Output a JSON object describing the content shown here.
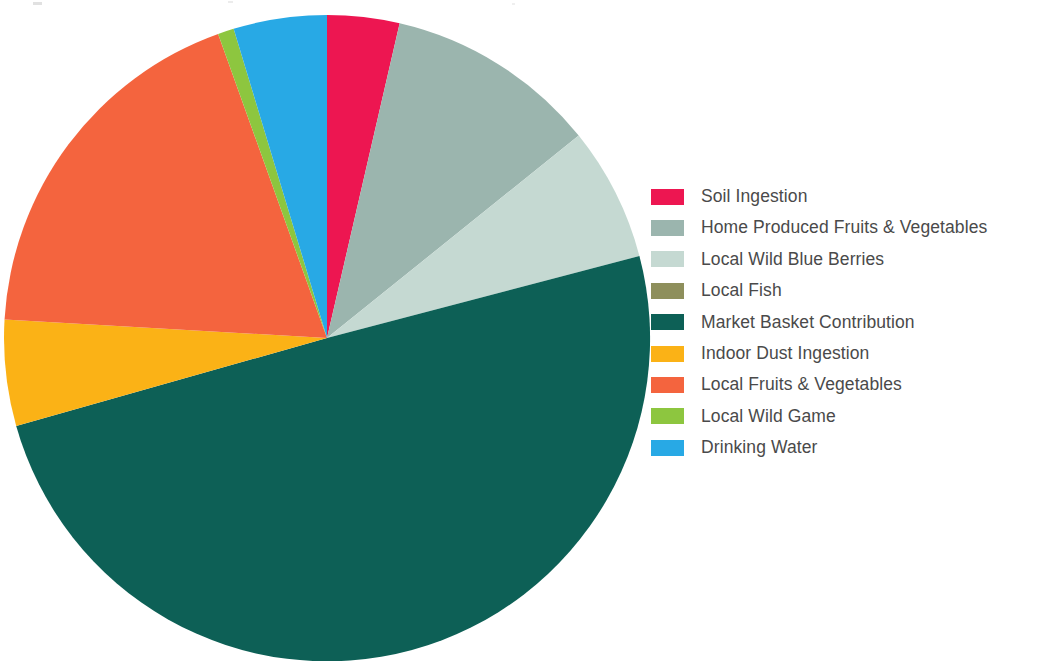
{
  "figure": {
    "background_color": "#ffffff",
    "legend_text_color": "#4a4a4a"
  },
  "chart_data": {
    "type": "pie",
    "title": "",
    "subtitle": "",
    "xlabel": "",
    "ylabel": "",
    "legend_position": "right",
    "grid": false,
    "start_angle_deg": 0,
    "direction": "clockwise",
    "units": "percent of total exposure",
    "categories": [
      "Soil Ingestion",
      "Home Produced Fruits & Vegetables",
      "Local Wild Blue Berries",
      "Local Fish",
      "Market Basket Contribution",
      "Indoor Dust Ingestion",
      "Local Fruits & Vegetables",
      "Local Wild Game",
      "Drinking Water"
    ],
    "values": [
      3.6,
      10.6,
      6.7,
      0.0,
      49.7,
      5.3,
      18.6,
      0.8,
      4.7
    ],
    "colors": [
      "#ED1651",
      "#9BB5AE",
      "#C5D9D2",
      "#8E8F5C",
      "#0D6056",
      "#FBB216",
      "#F4643E",
      "#8DC63F",
      "#28A9E5"
    ],
    "slices": [
      {
        "label": "Soil Ingestion",
        "value": 3.6,
        "color": "#ED1651",
        "start_deg": 0.0,
        "end_deg": 13.0
      },
      {
        "label": "Home Produced Fruits & Vegetables",
        "value": 10.6,
        "color": "#9BB5AE",
        "start_deg": 13.0,
        "end_deg": 51.2
      },
      {
        "label": "Local Wild Blue Berries",
        "value": 6.7,
        "color": "#C5D9D2",
        "start_deg": 51.2,
        "end_deg": 75.3
      },
      {
        "label": "Local Fish",
        "value": 0.0,
        "color": "#8E8F5C",
        "start_deg": 75.3,
        "end_deg": 75.3
      },
      {
        "label": "Market Basket Contribution",
        "value": 49.7,
        "color": "#0D6056",
        "start_deg": 75.3,
        "end_deg": 254.2
      },
      {
        "label": "Indoor Dust Ingestion",
        "value": 5.3,
        "color": "#FBB216",
        "start_deg": 254.2,
        "end_deg": 273.3
      },
      {
        "label": "Local Fruits & Vegetables",
        "value": 18.6,
        "color": "#F4643E",
        "start_deg": 273.3,
        "end_deg": 340.3
      },
      {
        "label": "Local Wild Game",
        "value": 0.8,
        "color": "#8DC63F",
        "start_deg": 340.3,
        "end_deg": 343.2
      },
      {
        "label": "Drinking Water",
        "value": 4.7,
        "color": "#28A9E5",
        "start_deg": 343.2,
        "end_deg": 360.0
      }
    ],
    "geometry": {
      "cx": 325,
      "cy": 325,
      "r": 323
    }
  },
  "legend": {
    "items": [
      {
        "label": "Soil Ingestion",
        "color": "#ED1651"
      },
      {
        "label": "Home Produced Fruits & Vegetables",
        "color": "#9BB5AE"
      },
      {
        "label": "Local Wild Blue Berries",
        "color": "#C5D9D2"
      },
      {
        "label": "Local Fish",
        "color": "#8E8F5C"
      },
      {
        "label": "Market Basket Contribution",
        "color": "#0D6056"
      },
      {
        "label": "Indoor Dust Ingestion",
        "color": "#FBB216"
      },
      {
        "label": "Local Fruits & Vegetables",
        "color": "#F4643E"
      },
      {
        "label": "Local Wild Game",
        "color": "#8DC63F"
      },
      {
        "label": "Drinking Water",
        "color": "#28A9E5"
      }
    ]
  }
}
